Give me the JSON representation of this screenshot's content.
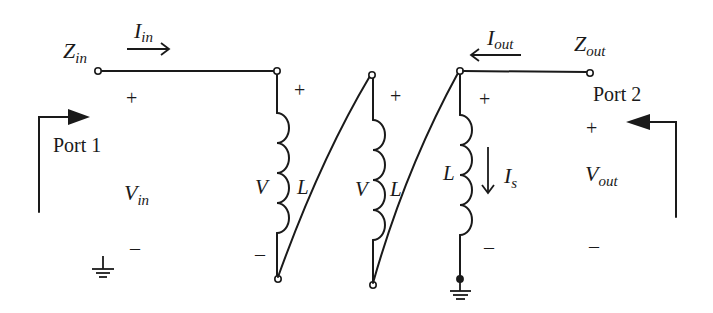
{
  "diagram": {
    "type": "circuit-schematic",
    "colors": {
      "ink": "#1a1a1a",
      "background": "#ffffff"
    },
    "labels": {
      "z_in": {
        "main": "Z",
        "sub": "in"
      },
      "i_in": {
        "main": "I",
        "sub": "in"
      },
      "i_out": {
        "main": "I",
        "sub": "out"
      },
      "z_out": {
        "main": "Z",
        "sub": "out"
      },
      "port1": "Port 1",
      "port2": "Port 2",
      "v_in": {
        "main": "V",
        "sub": "in"
      },
      "v_out": {
        "main": "V",
        "sub": "out"
      },
      "i_s": {
        "main": "I",
        "sub": "s"
      },
      "inductor1": {
        "voltage": "V",
        "inductance": "L"
      },
      "inductor2": {
        "voltage": "V",
        "inductance": "L"
      },
      "inductor3": {
        "inductance": "L"
      },
      "plus": "+",
      "minus": "–"
    },
    "polarity": {
      "port1_plus": "+",
      "port1_minus": "–",
      "inductor1_plus": "+",
      "inductor1_minus": "–",
      "inductor2_plus": "+",
      "inductor3_plus": "+",
      "inductor3_minus": "–",
      "port2_plus": "+",
      "port2_minus": "–"
    },
    "components": [
      {
        "id": "inductor1",
        "kind": "inductor",
        "label": "L"
      },
      {
        "id": "inductor2",
        "kind": "inductor",
        "label": "L"
      },
      {
        "id": "inductor3",
        "kind": "inductor",
        "label": "L"
      },
      {
        "id": "ground1",
        "kind": "ground"
      },
      {
        "id": "ground2",
        "kind": "ground"
      }
    ]
  }
}
